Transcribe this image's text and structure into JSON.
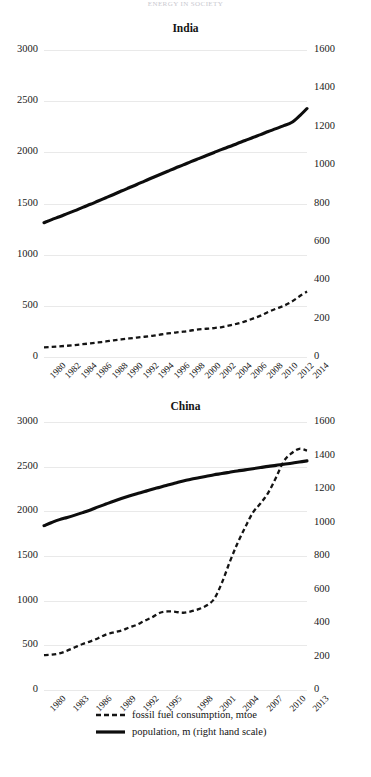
{
  "top_title": "ENERGY IN SOCIETY",
  "legend": {
    "items": [
      {
        "label": "fossil fuel consumption, mtoe",
        "style": "dashed",
        "key_name": "legend-key-fossil"
      },
      {
        "label": "population, m (right hand scale)",
        "style": "solid",
        "key_name": "legend-key-population"
      }
    ]
  },
  "chart_data": [
    {
      "type": "line",
      "title": "India",
      "xlabel": "",
      "ylabel": "",
      "ylim": [
        0,
        3000
      ],
      "y2lim": [
        0,
        1600
      ],
      "yticks": [
        "3000",
        "2500",
        "2000",
        "1500",
        "1000",
        "500",
        "0"
      ],
      "ytick_values": [
        3000,
        2500,
        2000,
        1500,
        1000,
        500,
        0
      ],
      "y2ticks": [
        "1600",
        "1400",
        "1200",
        "1000",
        "800",
        "600",
        "400",
        "200",
        "0"
      ],
      "y2tick_values": [
        1600,
        1400,
        1200,
        1000,
        800,
        600,
        400,
        200,
        0
      ],
      "grid": true,
      "legend_position": "bottom",
      "x": [
        1980,
        1981,
        1982,
        1983,
        1984,
        1985,
        1986,
        1987,
        1988,
        1989,
        1990,
        1991,
        1992,
        1993,
        1994,
        1995,
        1996,
        1997,
        1998,
        1999,
        2000,
        2001,
        2002,
        2003,
        2004,
        2005,
        2006,
        2007,
        2008,
        2009,
        2010,
        2011,
        2012,
        2013,
        2014
      ],
      "xticklabels": [
        "1980",
        "1982",
        "1984",
        "1986",
        "1988",
        "1990",
        "1992",
        "1994",
        "1996",
        "1998",
        "2000",
        "2002",
        "2004",
        "2006",
        "2008",
        "2010",
        "2012",
        "2014"
      ],
      "series": [
        {
          "name": "fossil fuel consumption, mtoe",
          "axis": "left",
          "style": "dashed",
          "values": [
            95,
            99,
            104,
            110,
            117,
            125,
            133,
            142,
            152,
            163,
            172,
            181,
            190,
            198,
            207,
            219,
            230,
            239,
            247,
            259,
            270,
            276,
            283,
            293,
            308,
            326,
            348,
            375,
            404,
            441,
            472,
            500,
            540,
            592,
            640
          ]
        },
        {
          "name": "population, m (right hand scale)",
          "axis": "right",
          "style": "solid",
          "values": [
            700,
            716,
            731,
            747,
            763,
            780,
            796,
            813,
            830,
            847,
            865,
            882,
            899,
            917,
            934,
            951,
            968,
            985,
            1001,
            1018,
            1034,
            1050,
            1066,
            1082,
            1097,
            1113,
            1128,
            1144,
            1159,
            1175,
            1190,
            1206,
            1222,
            1255,
            1295
          ]
        }
      ]
    },
    {
      "type": "line",
      "title": "China",
      "xlabel": "",
      "ylabel": "",
      "ylim": [
        0,
        3000
      ],
      "y2lim": [
        0,
        1600
      ],
      "yticks": [
        "3000",
        "2500",
        "2000",
        "1500",
        "1000",
        "500",
        "0"
      ],
      "ytick_values": [
        3000,
        2500,
        2000,
        1500,
        1000,
        500,
        0
      ],
      "y2ticks": [
        "1600",
        "1400",
        "1200",
        "1000",
        "800",
        "600",
        "400",
        "200",
        "0"
      ],
      "y2tick_values": [
        1600,
        1400,
        1200,
        1000,
        800,
        600,
        400,
        200,
        0
      ],
      "grid": true,
      "legend_position": "bottom",
      "x": [
        1980,
        1981,
        1982,
        1983,
        1984,
        1985,
        1986,
        1987,
        1988,
        1989,
        1990,
        1991,
        1992,
        1993,
        1994,
        1995,
        1996,
        1997,
        1998,
        1999,
        2000,
        2001,
        2002,
        2003,
        2004,
        2005,
        2006,
        2007,
        2008,
        2009,
        2010,
        2011,
        2012,
        2013,
        2014
      ],
      "xticklabels": [
        "1980",
        "1983",
        "1986",
        "1989",
        "1992",
        "1995",
        "1998",
        "2001",
        "2004",
        "2007",
        "2010",
        "2013"
      ],
      "series": [
        {
          "name": "fossil fuel consumption, mtoe",
          "axis": "left",
          "style": "dashed",
          "values": [
            390,
            395,
            410,
            440,
            478,
            515,
            545,
            580,
            620,
            645,
            665,
            700,
            730,
            775,
            815,
            865,
            880,
            875,
            865,
            880,
            905,
            945,
            1020,
            1200,
            1430,
            1640,
            1820,
            1985,
            2090,
            2210,
            2380,
            2560,
            2650,
            2700,
            2680
          ]
        },
        {
          "name": "population, m (right hand scale)",
          "axis": "right",
          "style": "solid",
          "values": [
            981,
            1000,
            1017,
            1030,
            1044,
            1059,
            1075,
            1093,
            1110,
            1127,
            1143,
            1158,
            1172,
            1185,
            1199,
            1211,
            1224,
            1236,
            1248,
            1258,
            1267,
            1276,
            1285,
            1292,
            1300,
            1308,
            1314,
            1321,
            1328,
            1335,
            1341,
            1348,
            1354,
            1361,
            1368
          ]
        }
      ]
    }
  ]
}
